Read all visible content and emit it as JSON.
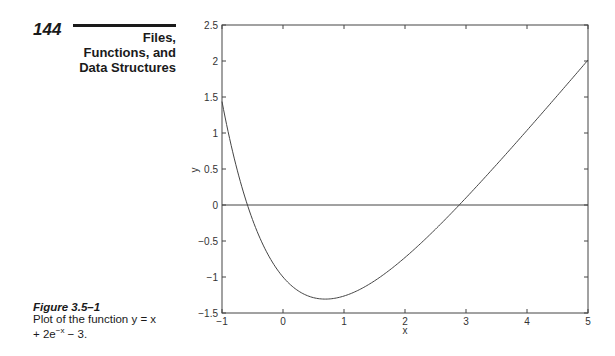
{
  "header": {
    "page_number": "144",
    "chapter_line1": "Files,",
    "chapter_line2": "Functions, and",
    "chapter_line3": "Data Structures"
  },
  "caption": {
    "label": "Figure 3.5–1",
    "text_line1": "Plot of the function y = x",
    "text_line2": "+ 2e",
    "text_sup": "−x",
    "text_line2_end": " − 3."
  },
  "chart_data": {
    "type": "line",
    "title": "",
    "xlabel": "x",
    "ylabel": "y",
    "xlim": [
      -1,
      5
    ],
    "ylim": [
      -1.5,
      2.5
    ],
    "xticks": [
      "-1",
      "0",
      "1",
      "2",
      "3",
      "4",
      "5"
    ],
    "yticks": [
      "-1.5",
      "-1",
      "-0.5",
      "0",
      "0.5",
      "1",
      "1.5",
      "2",
      "2.5"
    ],
    "grid": false,
    "legend": null,
    "series": [
      {
        "name": "y = x + 2e^(-x) - 3",
        "x": [
          -1,
          -0.75,
          -0.5,
          -0.25,
          0,
          0.25,
          0.5,
          0.693,
          1,
          1.5,
          2,
          2.5,
          3,
          3.5,
          4,
          4.5,
          5
        ],
        "y": [
          1.437,
          0.484,
          -0.203,
          -0.682,
          -1.0,
          -1.192,
          -1.287,
          -1.307,
          -1.264,
          -1.054,
          -0.729,
          -0.336,
          0.1,
          0.56,
          1.037,
          1.522,
          2.013
        ]
      },
      {
        "name": "y = 0 reference line",
        "x": [
          -1,
          5
        ],
        "y": [
          0,
          0
        ]
      }
    ]
  }
}
